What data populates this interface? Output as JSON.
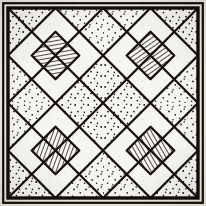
{
  "figure": {
    "medium": "ink line drawing on aged paper",
    "colors": {
      "ink": "#15120e",
      "paper": "#efece3",
      "tile_fill": "#f7f5ef",
      "stipple_dot": "#1a1713",
      "hatch_line": "#15120e",
      "border": "#100d0a"
    },
    "canvas": {
      "width": 206,
      "height": 206
    }
  },
  "border": {
    "name": "double frame",
    "outer_rect": {
      "x": 3,
      "y": 3,
      "width": 200,
      "height": 200,
      "stroke_width": 2.2
    },
    "inner_rect": {
      "x": 8,
      "y": 8,
      "width": 190,
      "height": 190,
      "stroke_width": 3.4
    }
  },
  "grid": {
    "rows": 2,
    "columns": 2,
    "tile_count": 4,
    "tile_size": 95,
    "origin_x": 8,
    "origin_y": 8
  },
  "tiles": [
    {
      "id": "tile-top-left",
      "position": "top-left",
      "row": 0,
      "column": 0,
      "x": 8,
      "y": 8,
      "size": 95,
      "hatch_direction": "vertical-leaning",
      "hatch_angle_deg": 80,
      "hatch_spacing": 4,
      "stipple_density": "medium"
    },
    {
      "id": "tile-top-right",
      "position": "top-right",
      "row": 0,
      "column": 1,
      "x": 103,
      "y": 8,
      "size": 95,
      "hatch_direction": "forward-slash",
      "hatch_angle_deg": 55,
      "hatch_spacing": 4,
      "stipple_density": "medium"
    },
    {
      "id": "tile-bottom-left",
      "position": "bottom-left",
      "row": 1,
      "column": 0,
      "x": 8,
      "y": 103,
      "size": 95,
      "hatch_direction": "back-slash",
      "hatch_angle_deg": 20,
      "hatch_spacing": 4,
      "stipple_density": "medium"
    },
    {
      "id": "tile-bottom-right",
      "position": "bottom-right",
      "row": 1,
      "column": 1,
      "x": 103,
      "y": 103,
      "size": 95,
      "hatch_direction": "forward-slash",
      "hatch_angle_deg": 150,
      "hatch_spacing": 4,
      "stipple_density": "medium"
    }
  ],
  "tile_anatomy": {
    "inscribed_diamond": "diamond connecting the four edge midpoints of the tile",
    "diagonals": "two corner-to-corner diagonals crossing at the tile centre",
    "corner_triangles": "four stippled triangles between the diamond and the tile corners",
    "inner_triangles": "four blank triangles pointing toward the tile centre",
    "central_rhombus": "hatched rhombus at the tile centre, half-scale of the inscribed diamond"
  },
  "vertices": {
    "panel_centre": [
      103,
      103
    ],
    "edge_midpoints": [
      [
        103,
        8
      ],
      [
        198,
        103
      ],
      [
        103,
        198
      ],
      [
        8,
        103
      ]
    ],
    "panel_corners": [
      [
        8,
        8
      ],
      [
        198,
        8
      ],
      [
        198,
        198
      ],
      [
        8,
        198
      ]
    ]
  }
}
